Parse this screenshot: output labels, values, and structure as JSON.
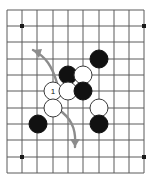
{
  "diagram": {
    "kind": "go-board-diagram",
    "title": "",
    "board": {
      "cols": 10,
      "rows": 11,
      "x_coords": [
        7,
        22,
        37,
        53,
        68,
        83,
        99,
        114,
        129,
        144
      ],
      "y_coords": [
        10,
        26,
        42,
        59,
        75,
        91,
        108,
        124,
        140,
        157,
        173
      ],
      "line_color": "#5a5a5a",
      "line_width": 1,
      "background_color": "#ffffff",
      "star_points": [
        {
          "x": 22,
          "y": 26
        },
        {
          "x": 144,
          "y": 26
        },
        {
          "x": 22,
          "y": 157
        },
        {
          "x": 144,
          "y": 157
        }
      ],
      "star_point_color": "#1a1a1a",
      "star_point_size": 4
    },
    "stones": [
      {
        "id": "black-1",
        "color": "black",
        "x": 99,
        "y": 59,
        "label": ""
      },
      {
        "id": "black-2",
        "color": "black",
        "x": 68,
        "y": 75,
        "label": ""
      },
      {
        "id": "white-1",
        "color": "white",
        "x": 83,
        "y": 75,
        "label": ""
      },
      {
        "id": "white-2-move",
        "color": "white",
        "x": 53,
        "y": 91,
        "label": "1"
      },
      {
        "id": "white-3",
        "color": "white",
        "x": 68,
        "y": 91,
        "label": ""
      },
      {
        "id": "black-3",
        "color": "black",
        "x": 83,
        "y": 91,
        "label": ""
      },
      {
        "id": "white-4",
        "color": "white",
        "x": 53,
        "y": 108,
        "label": ""
      },
      {
        "id": "white-5",
        "color": "white",
        "x": 99,
        "y": 108,
        "label": ""
      },
      {
        "id": "black-4",
        "color": "black",
        "x": 38,
        "y": 124,
        "label": ""
      },
      {
        "id": "black-5",
        "color": "black",
        "x": 99,
        "y": 124,
        "label": ""
      }
    ],
    "stone_radius": 9,
    "stone_colors": {
      "black_fill": "#111111",
      "black_stroke": "#111111",
      "white_fill": "#ffffff",
      "white_stroke": "#3a3a3a",
      "label_on_white": "#111111"
    },
    "arrows": [
      {
        "id": "arrow-up-left",
        "direction": "up-left",
        "color": "#8c8c8c",
        "path": "M 57 83 C 52 66 46 57 33 50",
        "head_points": "33,50 42,49 39,58",
        "width": 2.4
      },
      {
        "id": "arrow-down",
        "direction": "down",
        "color": "#8c8c8c",
        "path": "M 62 112 C 74 122 76 133 75 147",
        "head_points": "75,147 70,139 80,139",
        "width": 2.4
      }
    ],
    "label_font_size": 8
  }
}
